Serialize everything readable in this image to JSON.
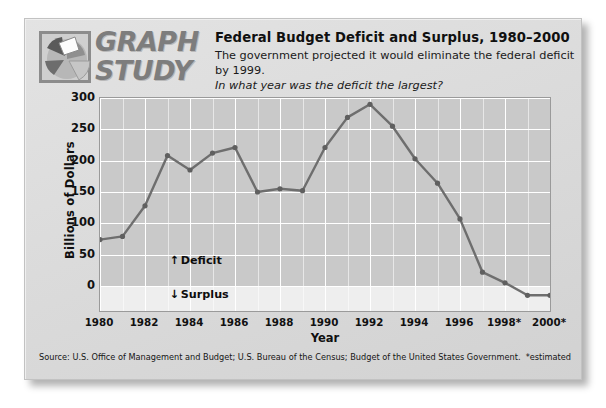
{
  "card": {
    "logo": {
      "icon_name": "pie-chart-logo-icon",
      "line1": "GRAPH",
      "line2": "STUDY"
    },
    "title": "Federal Budget Deficit and Surplus, 1980–2000",
    "subtitle": "The government projected it would eliminate the federal deficit by 1999.",
    "question": "In what year was the deficit the largest?",
    "source": "Source: U.S. Office of Management and Budget; U.S. Bureau of the Census; Budget of the United States Government.",
    "estimated_note": "*estimated"
  },
  "annotations": {
    "deficit_arrow": "↑",
    "deficit_label": "Deficit",
    "surplus_arrow": "↓",
    "surplus_label": "Surplus"
  },
  "colors": {
    "plot_background": "#c9c9c9",
    "surplus_band": "#eeeeee",
    "gridline": "#ffffff",
    "line": "#6e6e6e",
    "marker": "#5f5f5f",
    "card_background": "#dcdcdc",
    "text": "#101010"
  },
  "chart_data": {
    "type": "line",
    "title": "Federal Budget Deficit and Surplus, 1980–2000",
    "xlabel": "Year",
    "ylabel": "Billions of Dollars",
    "ylim": [
      -40,
      300
    ],
    "yticks": [
      0,
      50,
      100,
      150,
      200,
      250,
      300
    ],
    "ytick_labels": [
      "0",
      "50",
      "100",
      "150",
      "200",
      "250",
      "300"
    ],
    "xlim": [
      1980,
      2000
    ],
    "xticks": [
      1980,
      1982,
      1984,
      1986,
      1988,
      1990,
      1992,
      1994,
      1996,
      1998,
      2000
    ],
    "xtick_labels": [
      "1980",
      "1982",
      "1984",
      "1986",
      "1988",
      "1990",
      "1992",
      "1994",
      "1996",
      "1998*",
      "2000*"
    ],
    "grid": true,
    "legend": "none",
    "x": [
      1980,
      1981,
      1982,
      1983,
      1984,
      1985,
      1986,
      1987,
      1988,
      1989,
      1990,
      1991,
      1992,
      1993,
      1994,
      1995,
      1996,
      1997,
      1998,
      1999,
      2000
    ],
    "values": [
      74,
      79,
      128,
      208,
      185,
      212,
      221,
      150,
      155,
      152,
      221,
      269,
      290,
      255,
      203,
      164,
      107,
      22,
      5,
      -15,
      -15
    ],
    "series": [
      {
        "name": "Federal budget deficit / surplus",
        "values": [
          74,
          79,
          128,
          208,
          185,
          212,
          221,
          150,
          155,
          152,
          221,
          269,
          290,
          255,
          203,
          164,
          107,
          22,
          5,
          -15,
          -15
        ]
      }
    ],
    "estimated_years": [
      1998,
      1999,
      2000
    ],
    "peak": {
      "year": 1992,
      "value": 290
    }
  }
}
